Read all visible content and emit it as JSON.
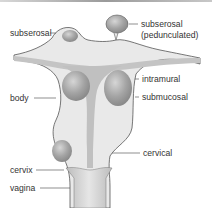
{
  "figure": {
    "type": "anatomical diagram",
    "labels": {
      "subserosal": "subserosal",
      "subserosal_pedunculated_1": "subserosal",
      "subserosal_pedunculated_2": "(pedunculated)",
      "intramural": "intramural",
      "submucosal": "submucosal",
      "body": "body",
      "cervical": "cervical",
      "cervix": "cervix",
      "vagina": "vagina"
    },
    "colors": {
      "tissue": "#e9e9e9",
      "cavity": "#b8b8b8",
      "fibroid": "#9e9e9e",
      "outline": "#555555"
    }
  }
}
